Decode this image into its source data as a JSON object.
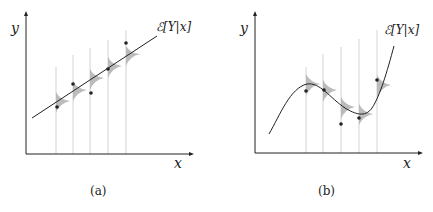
{
  "figure": {
    "panel_a": {
      "caption": "(a)",
      "x_label": "x",
      "y_label": "y",
      "curve_label": "ℰ[Y|x]",
      "curve_type": "linear"
    },
    "panel_b": {
      "caption": "(b)",
      "x_label": "x",
      "y_label": "y",
      "curve_label": "ℰ[Y|x]",
      "curve_type": "nonlinear"
    },
    "colors": {
      "axis": "#222222",
      "curve": "#222222",
      "density": "#b8b8b8",
      "guide": "#c8c8c8",
      "point": "#222222"
    }
  }
}
